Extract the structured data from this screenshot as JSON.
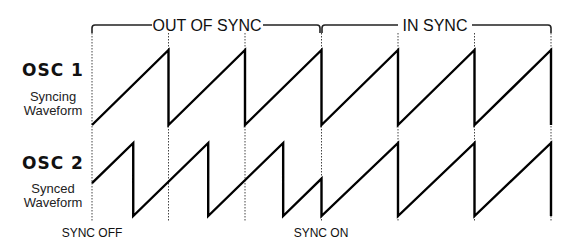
{
  "diagram": {
    "ranges": [
      {
        "label": "OUT OF SYNC"
      },
      {
        "label": "IN SYNC"
      }
    ],
    "oscillators": [
      {
        "title": "OSC 1",
        "subtitle_lines": [
          "Syncing",
          "Waveform"
        ],
        "role": "master"
      },
      {
        "title": "OSC 2",
        "subtitle_lines": [
          "Synced",
          "Waveform"
        ],
        "role": "slave"
      }
    ],
    "markers": [
      {
        "label": "SYNC OFF"
      },
      {
        "label": "SYNC ON"
      }
    ],
    "waveform_type": "sawtooth",
    "timing": {
      "osc1_cycles_total": 6,
      "out_of_sync_cycles": 3,
      "in_sync_cycles": 3,
      "osc2_free_run_period_ratio": 0.98,
      "osc2_initial_phase": 0.45
    }
  }
}
